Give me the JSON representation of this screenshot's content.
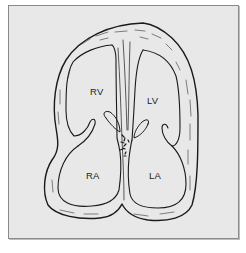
{
  "diagram": {
    "type": "anatomical-illustration",
    "colors": {
      "background": "#e8e8e8",
      "frame": "#8a8a8a",
      "stroke": "#1a1a1a"
    },
    "labels": [
      {
        "id": "rv",
        "text": "RV",
        "x": 90,
        "y": 86
      },
      {
        "id": "lv",
        "text": "LV",
        "x": 147,
        "y": 95
      },
      {
        "id": "ra",
        "text": "RA",
        "x": 86,
        "y": 170
      },
      {
        "id": "la",
        "text": "LA",
        "x": 149,
        "y": 170
      }
    ]
  }
}
